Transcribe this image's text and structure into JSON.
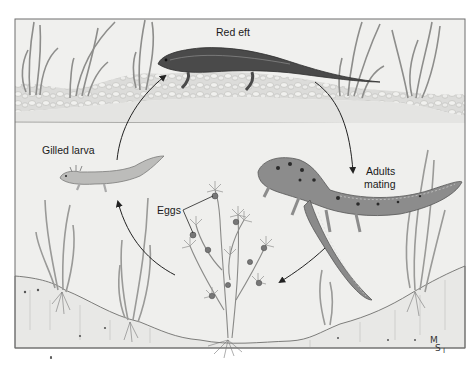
{
  "diagram": {
    "stages": [
      {
        "id": "red-eft",
        "label": "Red eft"
      },
      {
        "id": "adults-mating",
        "label_line1": "Adults",
        "label_line2": "mating"
      },
      {
        "id": "eggs",
        "label": "Eggs"
      },
      {
        "id": "gilled-larva",
        "label": "Gilled larva"
      }
    ],
    "cycle_order": [
      "Red eft",
      "Adults mating",
      "Eggs",
      "Gilled larva",
      "Red eft"
    ],
    "signature": {
      "line1": "M",
      "line2": "S",
      "line3": "I"
    },
    "colors": {
      "frame": "#6e6e6e",
      "water": "#ededeb",
      "land": "#e4e4e2",
      "pebbles": "#d2d2d0",
      "eft": "#4a4a4a",
      "adult": "#8c8c8c",
      "larva": "#b9b9b9",
      "plants": "#9a9a9a",
      "arrow": "#222222"
    }
  }
}
